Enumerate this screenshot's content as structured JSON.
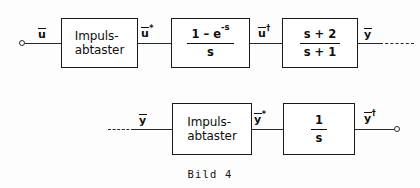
{
  "figure": {
    "caption": "Bild 4",
    "ink_color": "#101010",
    "background_color": "#fdfdfd"
  },
  "rows": {
    "top": {
      "input_signal": "u",
      "input_signal_bar": true,
      "sampler_line1": "Impuls-",
      "sampler_line2": "abtaster",
      "signal_after_sampler": "u",
      "signal_after_sampler_sup": "*",
      "hold_numerator": "1 – e",
      "hold_numerator_sup": "-s",
      "hold_denominator": "s",
      "signal_after_hold": "u",
      "signal_after_hold_sup": "†",
      "plant_numerator": "s + 2",
      "plant_denominator": "s + 1",
      "output_signal": "y",
      "output_signal_sup": ""
    },
    "bottom": {
      "input_signal": "y",
      "sampler_line1": "Impuls-",
      "sampler_line2": "abtaster",
      "signal_after_sampler": "y",
      "signal_after_sampler_sup": "*",
      "integrator_numerator": "1",
      "integrator_denominator": "s",
      "output_signal": "y",
      "output_signal_sup": "†"
    }
  }
}
